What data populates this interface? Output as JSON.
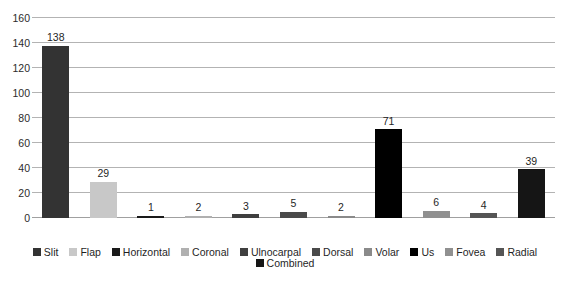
{
  "chart_data": {
    "type": "bar",
    "title": "",
    "subtitle": "",
    "xlabel": "",
    "ylabel": "",
    "categories": [
      "Slit",
      "Flap",
      "Horizontal",
      "Coronal",
      "Ulnocarpal",
      "Dorsal",
      "Volar",
      "Us",
      "Fovea",
      "Radial",
      "Combined"
    ],
    "values": [
      138,
      29,
      1,
      2,
      3,
      5,
      2,
      71,
      6,
      4,
      39
    ],
    "data_labels": [
      "138",
      "29",
      "1",
      "2",
      "3",
      "5",
      "2",
      "71",
      "6",
      "4",
      "39"
    ],
    "bar_colors": [
      "#333333",
      "#c8c8c8",
      "#1a1a1a",
      "#b0b0b0",
      "#3f3f3f",
      "#4a4a4a",
      "#8a8a8a",
      "#000000",
      "#909090",
      "#555555",
      "#151515"
    ],
    "ylim": [
      0,
      160
    ],
    "ytick_values": [
      0,
      20,
      40,
      60,
      80,
      100,
      120,
      140,
      160
    ],
    "ytick_labels": [
      "0",
      "20",
      "40",
      "60",
      "80",
      "100",
      "120",
      "140",
      "160"
    ],
    "grid": true,
    "grid_color": "#b3b3b3",
    "legend_position": "bottom",
    "legend_entries": [
      {
        "label": "Slit",
        "color": "#333333"
      },
      {
        "label": "Flap",
        "color": "#c8c8c8"
      },
      {
        "label": "Horizontal",
        "color": "#1a1a1a"
      },
      {
        "label": "Coronal",
        "color": "#b0b0b0"
      },
      {
        "label": "Ulnocarpal",
        "color": "#3f3f3f"
      },
      {
        "label": "Dorsal",
        "color": "#4a4a4a"
      },
      {
        "label": "Volar",
        "color": "#8a8a8a"
      },
      {
        "label": "Us",
        "color": "#000000"
      },
      {
        "label": "Fovea",
        "color": "#909090"
      },
      {
        "label": "Radial",
        "color": "#555555"
      },
      {
        "label": "Combined",
        "color": "#151515"
      }
    ],
    "background_color": "#ffffff",
    "text_color": "#1f1f1f"
  }
}
